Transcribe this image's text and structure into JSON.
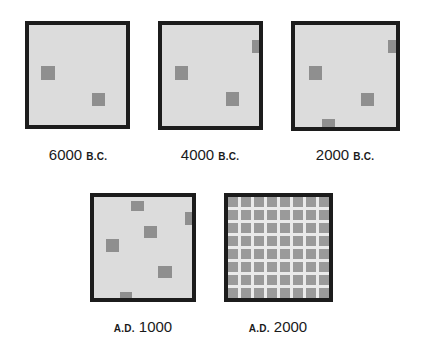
{
  "colors": {
    "background": "#ffffff",
    "panel_fill": "#dcdcdc",
    "panel_border": "#1c1c1c",
    "settlement_square": "#8f8f8f",
    "grid_line": "#eaeaea",
    "grid_cell": "#9a9a9a"
  },
  "panels": [
    {
      "id": "6000bc",
      "label": {
        "year": "6000",
        "era": "B.C.",
        "era_position": "after"
      },
      "box": {
        "x": 25,
        "y": 21,
        "w": 105,
        "h": 108
      },
      "squares": [
        {
          "x": 12,
          "y": 41,
          "w": 14,
          "h": 14
        },
        {
          "x": 63,
          "y": 68,
          "w": 13,
          "h": 13
        }
      ]
    },
    {
      "id": "4000bc",
      "label": {
        "year": "4000",
        "era": "B.C.",
        "era_position": "after"
      },
      "box": {
        "x": 158,
        "y": 21,
        "w": 105,
        "h": 109
      },
      "squares": [
        {
          "x": 90,
          "y": 15,
          "w": 12,
          "h": 13
        },
        {
          "x": 13,
          "y": 41,
          "w": 13,
          "h": 14
        },
        {
          "x": 64,
          "y": 67,
          "w": 13,
          "h": 14
        }
      ]
    },
    {
      "id": "2000bc",
      "label": {
        "year": "2000",
        "era": "B.C.",
        "era_position": "after"
      },
      "box": {
        "x": 291,
        "y": 21,
        "w": 109,
        "h": 110
      },
      "squares": [
        {
          "x": 93,
          "y": 15,
          "w": 12,
          "h": 13
        },
        {
          "x": 14,
          "y": 41,
          "w": 13,
          "h": 14
        },
        {
          "x": 66,
          "y": 68,
          "w": 13,
          "h": 13
        },
        {
          "x": 27,
          "y": 94,
          "w": 13,
          "h": 14
        }
      ]
    },
    {
      "id": "ad1000",
      "label": {
        "year": "1000",
        "era": "A.D.",
        "era_position": "before"
      },
      "box": {
        "x": 90,
        "y": 193,
        "w": 106,
        "h": 109
      },
      "squares": [
        {
          "x": 37,
          "y": 4,
          "w": 13,
          "h": 10
        },
        {
          "x": 91,
          "y": 15,
          "w": 11,
          "h": 13
        },
        {
          "x": 50,
          "y": 29,
          "w": 13,
          "h": 12
        },
        {
          "x": 12,
          "y": 42,
          "w": 13,
          "h": 13
        },
        {
          "x": 64,
          "y": 69,
          "w": 14,
          "h": 12
        },
        {
          "x": 26,
          "y": 95,
          "w": 12,
          "h": 10
        }
      ]
    },
    {
      "id": "ad2000",
      "label": {
        "year": "2000",
        "era": "A.D.",
        "era_position": "before"
      },
      "box": {
        "x": 224,
        "y": 193,
        "w": 109,
        "h": 109
      },
      "grid": {
        "rows": 8,
        "cols": 8
      }
    }
  ],
  "labels_layout": [
    {
      "cx": 78,
      "y": 146
    },
    {
      "cx": 210,
      "y": 146
    },
    {
      "cx": 345,
      "y": 146
    },
    {
      "cx": 143,
      "y": 318
    },
    {
      "cx": 278,
      "y": 318
    }
  ]
}
